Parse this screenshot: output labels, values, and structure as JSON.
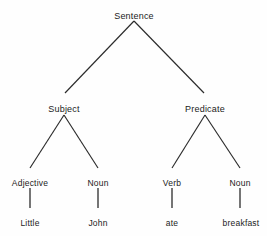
{
  "diagram": {
    "background_color": "#fefefe",
    "line_color": "#2b2b2b",
    "text_color": "#1b1b1b",
    "nodes": [
      {
        "id": "sentence",
        "label": "Sentence",
        "level": 0,
        "x": 134,
        "y": 11
      },
      {
        "id": "subject",
        "label": "Subject",
        "level": 1,
        "x": 64,
        "y": 104
      },
      {
        "id": "predicate",
        "label": "Predicate",
        "level": 1,
        "x": 205,
        "y": 104
      },
      {
        "id": "adjective",
        "label": "Adjective",
        "level": 2,
        "x": 30,
        "y": 178
      },
      {
        "id": "noun-left",
        "label": "Noun",
        "level": 2,
        "x": 98,
        "y": 178
      },
      {
        "id": "verb",
        "label": "Verb",
        "level": 2,
        "x": 172,
        "y": 178
      },
      {
        "id": "noun-right",
        "label": "Noun",
        "level": 2,
        "x": 240,
        "y": 178
      },
      {
        "id": "little",
        "label": "Little",
        "level": 3,
        "x": 30,
        "y": 218
      },
      {
        "id": "john",
        "label": "John",
        "level": 3,
        "x": 98,
        "y": 218
      },
      {
        "id": "ate",
        "label": "ate",
        "level": 3,
        "x": 172,
        "y": 218
      },
      {
        "id": "breakfast",
        "label": "breakfast",
        "level": 3,
        "x": 241,
        "y": 218
      }
    ],
    "edges": [
      {
        "id": "sentence-subject",
        "from": "sentence",
        "to": "subject",
        "x1": 134,
        "y1": 21,
        "x2": 65,
        "y2": 93,
        "kind": "diagonal"
      },
      {
        "id": "sentence-predicate",
        "from": "sentence",
        "to": "predicate",
        "x1": 134,
        "y1": 21,
        "x2": 204,
        "y2": 93,
        "kind": "diagonal"
      },
      {
        "id": "subject-adjective",
        "from": "subject",
        "to": "adjective",
        "x1": 64,
        "y1": 115,
        "x2": 30,
        "y2": 168,
        "kind": "diagonal"
      },
      {
        "id": "subject-noun",
        "from": "subject",
        "to": "noun-left",
        "x1": 64,
        "y1": 115,
        "x2": 98,
        "y2": 168,
        "kind": "diagonal"
      },
      {
        "id": "predicate-verb",
        "from": "predicate",
        "to": "verb",
        "x1": 205,
        "y1": 115,
        "x2": 172,
        "y2": 168,
        "kind": "diagonal"
      },
      {
        "id": "predicate-noun",
        "from": "predicate",
        "to": "noun-right",
        "x1": 205,
        "y1": 115,
        "x2": 240,
        "y2": 168,
        "kind": "diagonal"
      },
      {
        "id": "adjective-little",
        "from": "adjective",
        "to": "little",
        "x1": 30,
        "y1": 188,
        "x2": 30,
        "y2": 208,
        "kind": "vertical"
      },
      {
        "id": "noun-john",
        "from": "noun-left",
        "to": "john",
        "x1": 98,
        "y1": 188,
        "x2": 98,
        "y2": 208,
        "kind": "vertical"
      },
      {
        "id": "verb-ate",
        "from": "verb",
        "to": "ate",
        "x1": 172,
        "y1": 188,
        "x2": 172,
        "y2": 208,
        "kind": "vertical"
      },
      {
        "id": "noun-breakfast",
        "from": "noun-right",
        "to": "breakfast",
        "x1": 240,
        "y1": 188,
        "x2": 240,
        "y2": 208,
        "kind": "vertical"
      }
    ]
  }
}
